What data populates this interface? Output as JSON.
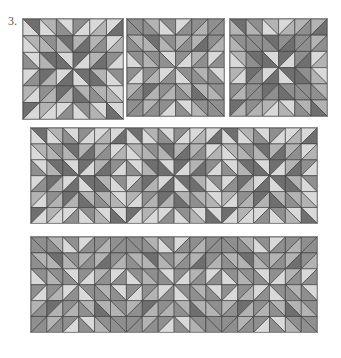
{
  "figure": {
    "label": "3.",
    "shades": {
      "light": "#d9d9d9",
      "medium_light": "#b3b3b3",
      "medium": "#8f8f8f",
      "dark": "#6f6f6f",
      "grid_line": "#3a3a3a",
      "border": "#8a8a8a"
    },
    "panels": [
      {
        "name": "block-variant-1",
        "x": 22,
        "y": 18,
        "cols": 6,
        "rows": 6,
        "cell": 16.7,
        "variant": 0
      },
      {
        "name": "block-variant-2",
        "x": 126,
        "y": 18,
        "cols": 6,
        "rows": 6,
        "cell": 16.2,
        "variant": 1
      },
      {
        "name": "block-variant-3",
        "x": 229,
        "y": 18,
        "cols": 6,
        "rows": 6,
        "cell": 16.2,
        "variant": 2
      },
      {
        "name": "row-layout-1",
        "x": 30,
        "y": 127,
        "cols": 18,
        "rows": 6,
        "cell": 15.9,
        "variant": 0
      },
      {
        "name": "row-layout-2",
        "x": 30,
        "y": 236,
        "cols": 18,
        "rows": 6,
        "cell": 15.9,
        "variant": 1
      }
    ]
  }
}
